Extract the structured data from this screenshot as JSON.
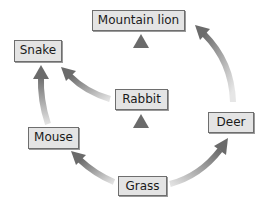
{
  "diagram": {
    "type": "food-web",
    "nodes": [
      {
        "id": "mountain_lion",
        "label": "Mountain lion",
        "x": 92,
        "y": 10,
        "w": 93,
        "h": 21
      },
      {
        "id": "snake",
        "label": "Snake",
        "x": 14,
        "y": 40,
        "w": 48,
        "h": 22
      },
      {
        "id": "rabbit",
        "label": "Rabbit",
        "x": 115,
        "y": 89,
        "w": 53,
        "h": 21
      },
      {
        "id": "mouse",
        "label": "Mouse",
        "x": 28,
        "y": 127,
        "w": 51,
        "h": 22
      },
      {
        "id": "deer",
        "label": "Deer",
        "x": 208,
        "y": 112,
        "w": 46,
        "h": 21
      },
      {
        "id": "grass",
        "label": "Grass",
        "x": 118,
        "y": 176,
        "w": 49,
        "h": 20
      }
    ],
    "edges": [
      {
        "from": "grass",
        "to": "rabbit"
      },
      {
        "from": "grass",
        "to": "mouse"
      },
      {
        "from": "grass",
        "to": "deer"
      },
      {
        "from": "rabbit",
        "to": "mountain_lion"
      },
      {
        "from": "rabbit",
        "to": "snake"
      },
      {
        "from": "mouse",
        "to": "snake"
      },
      {
        "from": "deer",
        "to": "mountain_lion"
      }
    ],
    "colors": {
      "box_fill": "#e4e4e4",
      "box_border": "#6e6e6e",
      "arrow_head": "#6b6b6b",
      "arrow_tail": "#d8d8d8"
    }
  }
}
